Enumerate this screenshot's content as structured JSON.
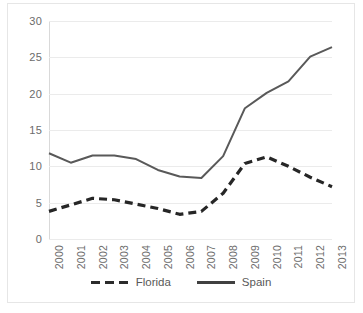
{
  "chart_data": {
    "type": "line",
    "title": "",
    "xlabel": "",
    "ylabel": "",
    "categories": [
      "2000",
      "2001",
      "2002",
      "2003",
      "2004",
      "2005",
      "2006",
      "2007",
      "2008",
      "2009",
      "2010",
      "2011",
      "2012",
      "2013"
    ],
    "series": [
      {
        "name": "Florida",
        "style": "dashed",
        "color": "#262626",
        "values": [
          3.8,
          4.7,
          5.6,
          5.4,
          4.8,
          4.2,
          3.4,
          3.8,
          6.3,
          10.4,
          11.3,
          10.0,
          8.5,
          7.2
        ]
      },
      {
        "name": "Spain",
        "style": "solid",
        "color": "#595959",
        "values": [
          11.8,
          10.5,
          11.5,
          11.5,
          11.0,
          9.5,
          8.6,
          8.4,
          11.4,
          18.0,
          20.1,
          21.7,
          25.1,
          26.4
        ]
      }
    ],
    "ylim": [
      0,
      30
    ],
    "yticks": [
      0,
      5,
      10,
      15,
      20,
      25,
      30
    ],
    "ytick_labels": [
      "0",
      "5",
      "10",
      "15",
      "20",
      "25",
      "30"
    ],
    "grid": true,
    "grid_color": "#ebebeb",
    "legend_position": "bottom",
    "axis_color": "#d9d9d9",
    "tick_label_color": "#6b6b6b",
    "background": "#ffffff"
  },
  "legend": {
    "items": [
      {
        "label": "Florida"
      },
      {
        "label": "Spain"
      }
    ]
  }
}
